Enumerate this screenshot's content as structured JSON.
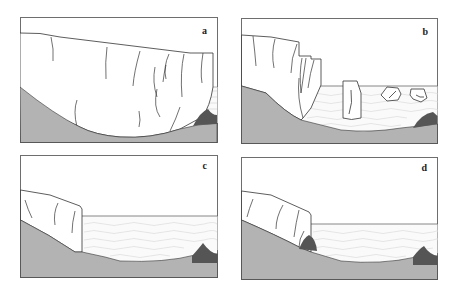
{
  "figure": {
    "colors": {
      "background": "#ffffff",
      "frame": "#6e6e6e",
      "bedrock": "#b3b3b3",
      "moraine": "#555555",
      "ice": "#ffffff",
      "ice_outline": "#333333",
      "water_lines": "#c8c8c8"
    },
    "panels": [
      {
        "id": "a",
        "label": "a",
        "caption_meaning": "glacier terminus grounded on moraine shoal"
      },
      {
        "id": "b",
        "label": "b",
        "caption_meaning": "calving with icebergs floating in water"
      },
      {
        "id": "c",
        "label": "c",
        "caption_meaning": "glacier retreated onto slope, fjord opened"
      },
      {
        "id": "d",
        "label": "d",
        "caption_meaning": "new moraine forming at retreated terminus"
      }
    ]
  }
}
